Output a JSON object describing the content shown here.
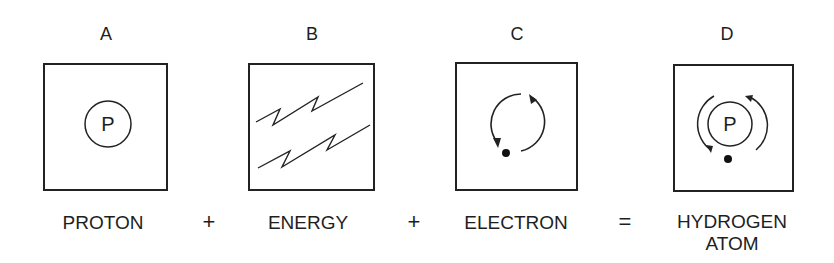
{
  "diagram": {
    "panels": [
      {
        "letter": "A",
        "caption": "PROTON",
        "icon": "proton-icon",
        "inner_label": "P"
      },
      {
        "letter": "B",
        "caption": "ENERGY",
        "icon": "energy-lightning-icon"
      },
      {
        "letter": "C",
        "caption": "ELECTRON",
        "icon": "electron-orbit-icon"
      },
      {
        "letter": "D",
        "caption_line1": "HYDROGEN",
        "caption_line2": "ATOM",
        "icon": "hydrogen-atom-icon",
        "inner_label": "P"
      }
    ],
    "operators": [
      "+",
      "+",
      "="
    ],
    "colors": {
      "stroke": "#222222",
      "text": "#1e1e1e",
      "background": "#ffffff"
    }
  }
}
